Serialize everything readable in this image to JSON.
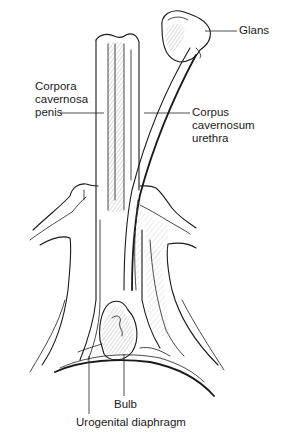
{
  "figure": {
    "type": "anatomical-line-drawing",
    "background": "#ffffff",
    "ink_color": "#1a1a1a",
    "labels": {
      "glans": {
        "lines": [
          "Glans"
        ]
      },
      "corpora_cavernosa_penis": {
        "lines": [
          "Corpora",
          "cavernosa",
          "penis"
        ]
      },
      "corpus_cavernosum_urethra": {
        "lines": [
          "Corpus",
          "cavernosum",
          "urethra"
        ]
      },
      "bulb": {
        "lines": [
          "Bulb"
        ]
      },
      "urogenital_diaphragm": {
        "lines": [
          "Urogenital diaphragm"
        ]
      }
    }
  }
}
